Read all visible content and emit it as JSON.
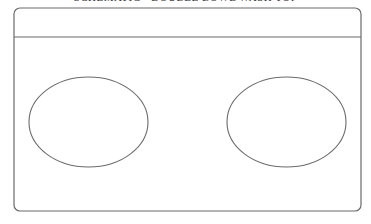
{
  "title": "SCHEMATIC - DOUBLE BOWL WASH TOP",
  "diagram": {
    "stroke_color": "#6b6b6b",
    "outline": {
      "x": 14,
      "y": 8,
      "width": 347,
      "height": 203,
      "radius": 6
    },
    "divider_y": 37,
    "bowls": [
      {
        "name": "left-bowl",
        "cx": 88.5,
        "cy": 122,
        "rx": 59.5,
        "ry": 45
      },
      {
        "name": "right-bowl",
        "cx": 286.5,
        "cy": 122,
        "rx": 59.5,
        "ry": 45
      }
    ]
  }
}
